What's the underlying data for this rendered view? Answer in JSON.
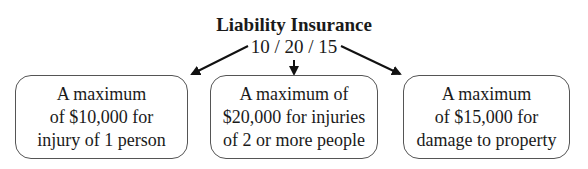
{
  "diagram": {
    "title": "Liability Insurance",
    "subtitle": "10 / 20 / 15",
    "boxes": [
      {
        "lines": [
          "A maximum",
          "of $10,000 for",
          "injury of 1 person"
        ]
      },
      {
        "lines": [
          "A maximum of",
          "$20,000 for injuries",
          "of 2 or more people"
        ]
      },
      {
        "lines": [
          "A maximum",
          "of $15,000 for",
          "damage to property"
        ]
      }
    ],
    "colors": {
      "text": "#1a1a1a",
      "border": "#555555",
      "arrow": "#111111"
    }
  }
}
